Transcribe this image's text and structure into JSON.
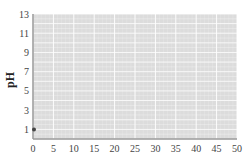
{
  "chart_data": {
    "type": "scatter",
    "title": "",
    "xlabel": "",
    "ylabel": "pH",
    "xlim": [
      0,
      50
    ],
    "ylim": [
      0,
      13
    ],
    "x_ticks": [
      0,
      5,
      10,
      15,
      20,
      25,
      30,
      35,
      40,
      45,
      50
    ],
    "y_ticks": [
      1,
      3,
      5,
      7,
      9,
      11,
      13
    ],
    "grid": true,
    "legend": null,
    "series": [
      {
        "name": "pH",
        "x": [
          0
        ],
        "y": [
          1
        ],
        "color": "#444444"
      }
    ]
  },
  "colors": {
    "plot_background": "#dcdcdc",
    "gridline": "#ffffff",
    "axis": "#999999",
    "point": "#444444"
  }
}
